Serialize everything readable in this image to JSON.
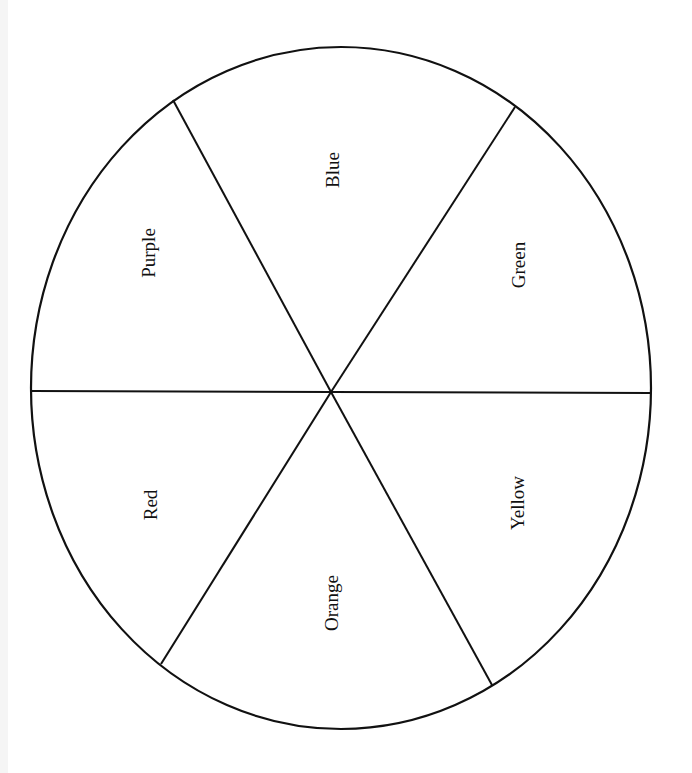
{
  "diagram": {
    "type": "color-wheel-template",
    "stroke_color": "#111111",
    "background": "#ffffff",
    "ellipse": {
      "cx": 341,
      "cy": 388,
      "rx": 310,
      "ry": 341
    },
    "center": {
      "x": 331,
      "y": 392
    },
    "segments": [
      {
        "label": "Blue",
        "x": 332,
        "y": 170
      },
      {
        "label": "Green",
        "x": 518,
        "y": 265
      },
      {
        "label": "Yellow",
        "x": 517,
        "y": 503
      },
      {
        "label": "Orange",
        "x": 331,
        "y": 603
      },
      {
        "label": "Red",
        "x": 150,
        "y": 505
      },
      {
        "label": "Purple",
        "x": 148,
        "y": 253
      }
    ],
    "spokes": [
      {
        "x": 173,
        "y": 100
      },
      {
        "x": 515,
        "y": 107
      },
      {
        "x": 651,
        "y": 393
      },
      {
        "x": 492,
        "y": 685
      },
      {
        "x": 161,
        "y": 664
      },
      {
        "x": 32,
        "y": 391
      }
    ]
  }
}
